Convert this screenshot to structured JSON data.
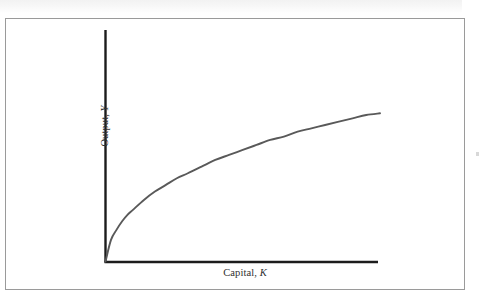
{
  "figure": {
    "frame_border_color": "#9a9a9a",
    "background_color": "#ffffff"
  },
  "axes": {
    "y_label_prefix": "Output, ",
    "y_label_variable": "Y",
    "x_label_prefix": "Capital, ",
    "x_label_variable": "K",
    "axis_color": "#1c1c1c"
  },
  "curve": {
    "color": "#595959",
    "label": "production-function-curve"
  },
  "chart_data": {
    "type": "line",
    "title": "",
    "subtitle": "",
    "xlabel": "Capital, K",
    "ylabel": "Output, Y",
    "grid": false,
    "legend": false,
    "xlim": [
      0,
      100
    ],
    "ylim": [
      0,
      100
    ],
    "axis_tick_labels": {
      "x": [],
      "y": []
    },
    "annotations": [],
    "series": [
      {
        "name": "Production function Y = F(K)",
        "description": "Concave increasing curve with diminishing marginal product of capital; starts at the origin, rises steeply, then flattens toward the right.",
        "x": [
          0,
          2,
          4,
          6,
          8,
          10,
          14,
          18,
          22,
          26,
          30,
          35,
          40,
          45,
          50,
          55,
          60,
          65,
          70,
          75,
          80,
          85,
          90,
          95,
          100
        ],
        "y": [
          0,
          13,
          19,
          24,
          28,
          31,
          37,
          42,
          46,
          50,
          53,
          57,
          61,
          64,
          67,
          70,
          73,
          75,
          78,
          80,
          82,
          84,
          86,
          88,
          89
        ]
      }
    ]
  }
}
